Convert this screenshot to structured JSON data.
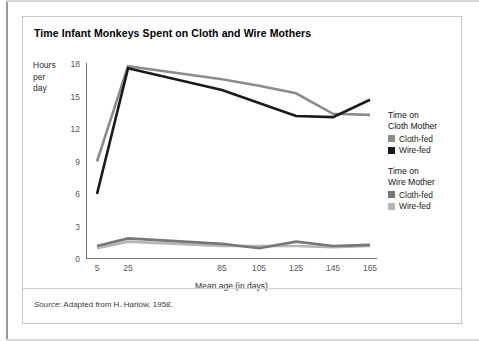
{
  "title": "Time Infant Monkeys Spent on Cloth and Wire Mothers",
  "axis": {
    "y_title_lines": [
      "Hours",
      "per",
      "day"
    ],
    "x_title": "Mean age (in days)",
    "y_ticks": [
      "0",
      "3",
      "6",
      "9",
      "12",
      "15",
      "18"
    ],
    "x_ticks": [
      "5",
      "25",
      "85",
      "105",
      "125",
      "145",
      "165"
    ]
  },
  "legend": {
    "groups": [
      {
        "title_lines": [
          "Time on",
          "Cloth Mother"
        ],
        "entries": [
          {
            "label": "Cloth-fed",
            "color": "#8c8c8c"
          },
          {
            "label": "Wire-fed",
            "color": "#1a1a1a"
          }
        ]
      },
      {
        "title_lines": [
          "Time on",
          "Wire Mother"
        ],
        "entries": [
          {
            "label": "Cloth-fed",
            "color": "#777777"
          },
          {
            "label": "Wire-fed",
            "color": "#b5b5b5"
          }
        ]
      }
    ]
  },
  "source": {
    "prefix": "Source",
    "text": ": Adapted from H. Harlow, 1958."
  },
  "chart_data": {
    "type": "line",
    "title": "Time Infant Monkeys Spent on Cloth and Wire Mothers",
    "xlabel": "Mean age (in days)",
    "ylabel": "Hours per day",
    "xlim": [
      5,
      165
    ],
    "ylim": [
      0,
      18
    ],
    "yticks": [
      0,
      3,
      6,
      9,
      12,
      15,
      18
    ],
    "xticks": [
      5,
      25,
      85,
      105,
      125,
      145,
      165
    ],
    "grid": false,
    "legend_position": "right",
    "x": [
      5,
      25,
      85,
      105,
      125,
      145,
      165
    ],
    "series": [
      {
        "name": "Time on Cloth Mother - Cloth-fed",
        "color": "#8c8c8c",
        "values": [
          9.0,
          17.8,
          16.6,
          16.0,
          15.3,
          13.4,
          13.3
        ]
      },
      {
        "name": "Time on Cloth Mother - Wire-fed",
        "color": "#1a1a1a",
        "values": [
          6.0,
          17.6,
          15.6,
          14.4,
          13.2,
          13.1,
          14.7
        ]
      },
      {
        "name": "Time on Wire Mother - Cloth-fed",
        "color": "#777777",
        "values": [
          1.2,
          1.9,
          1.4,
          1.0,
          1.6,
          1.2,
          1.3
        ]
      },
      {
        "name": "Time on Wire Mother - Wire-fed",
        "color": "#b5b5b5",
        "values": [
          1.0,
          1.6,
          1.2,
          1.2,
          1.2,
          1.1,
          1.2
        ]
      }
    ]
  }
}
